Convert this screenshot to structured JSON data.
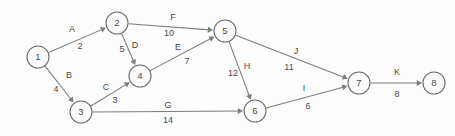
{
  "diagram": {
    "type": "directed-weighted-graph",
    "title": "",
    "width": 455,
    "height": 136,
    "background_color": "#fdfdfd",
    "node_stroke_color": "#6e6e6e",
    "edge_color": "#7d7d7d",
    "text_color": "#4a4a4a",
    "node_radius": 11,
    "nodes": [
      {
        "id": "1",
        "label": "1",
        "x": 38,
        "y": 57
      },
      {
        "id": "2",
        "label": "2",
        "x": 117,
        "y": 23
      },
      {
        "id": "3",
        "label": "3",
        "x": 81,
        "y": 112
      },
      {
        "id": "4",
        "label": "4",
        "x": 140,
        "y": 76
      },
      {
        "id": "5",
        "label": "5",
        "x": 225,
        "y": 31
      },
      {
        "id": "6",
        "label": "6",
        "x": 255,
        "y": 111
      },
      {
        "id": "7",
        "label": "7",
        "x": 359,
        "y": 83
      },
      {
        "id": "8",
        "label": "8",
        "x": 434,
        "y": 83
      }
    ],
    "edges": [
      {
        "name": "A",
        "weight": "2",
        "from": "1",
        "to": "2",
        "label_x": 72,
        "label_y": 30,
        "weight_x": 80,
        "weight_y": 47
      },
      {
        "name": "B",
        "weight": "4",
        "from": "1",
        "to": "3",
        "label_x": 69,
        "label_y": 76,
        "weight_x": 56,
        "weight_y": 90
      },
      {
        "name": "C",
        "weight": "3",
        "from": "3",
        "to": "4",
        "label_x": 106,
        "label_y": 88,
        "weight_x": 115,
        "weight_y": 101
      },
      {
        "name": "D",
        "weight": "5",
        "from": "2",
        "to": "4",
        "label_x": 135,
        "label_y": 46,
        "weight_x": 122,
        "weight_y": 50
      },
      {
        "name": "E",
        "weight": "7",
        "from": "4",
        "to": "5",
        "label_x": 178,
        "label_y": 48,
        "weight_x": 187,
        "weight_y": 62
      },
      {
        "name": "F",
        "weight": "10",
        "from": "2",
        "to": "5",
        "label_x": 173,
        "label_y": 18,
        "weight_x": 169,
        "weight_y": 34
      },
      {
        "name": "G",
        "weight": "14",
        "from": "3",
        "to": "6",
        "label_x": 168,
        "label_y": 106,
        "weight_x": 168,
        "weight_y": 121
      },
      {
        "name": "H",
        "weight": "12",
        "from": "5",
        "to": "6",
        "label_x": 247,
        "label_y": 67,
        "weight_x": 233,
        "weight_y": 74
      },
      {
        "name": "I",
        "weight": "6",
        "from": "6",
        "to": "7",
        "label_x": 304,
        "label_y": 89,
        "weight_x": 308,
        "weight_y": 107
      },
      {
        "name": "J",
        "weight": "11",
        "from": "5",
        "to": "7",
        "label_x": 296,
        "label_y": 52,
        "weight_x": 289,
        "weight_y": 68
      },
      {
        "name": "K",
        "weight": "8",
        "from": "7",
        "to": "8",
        "label_x": 397,
        "label_y": 73,
        "weight_x": 397,
        "weight_y": 95
      }
    ]
  }
}
